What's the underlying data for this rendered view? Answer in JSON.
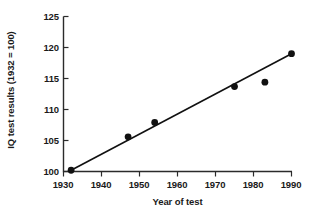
{
  "chart_data": {
    "type": "scatter",
    "title": "",
    "xlabel": "Year of test",
    "ylabel": "IQ test results (1932 = 100)",
    "xlim": [
      1930,
      1990
    ],
    "ylim": [
      100,
      125
    ],
    "xticks": [
      1930,
      1940,
      1950,
      1960,
      1970,
      1980,
      1990
    ],
    "yticks": [
      100,
      105,
      110,
      115,
      120,
      125
    ],
    "grid": false,
    "legend": false,
    "x": [
      1932,
      1947,
      1954,
      1975,
      1983,
      1990
    ],
    "y": [
      100.2,
      105.6,
      107.9,
      113.7,
      114.4,
      119.0
    ],
    "points": [
      {
        "x": 1932,
        "y": 100.2
      },
      {
        "x": 1947,
        "y": 105.6
      },
      {
        "x": 1954,
        "y": 107.9
      },
      {
        "x": 1975,
        "y": 113.7
      },
      {
        "x": 1983,
        "y": 114.4
      },
      {
        "x": 1990,
        "y": 119.0
      }
    ],
    "trend_line": {
      "type": "line",
      "x": [
        1932,
        1990
      ],
      "y": [
        100.2,
        119.0
      ]
    },
    "marker_color": "#111111",
    "line_color": "#111111",
    "axis_color": "#2b2b2b",
    "background_color": "#ffffff"
  }
}
